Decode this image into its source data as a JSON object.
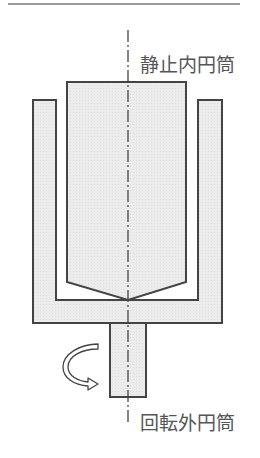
{
  "labels": {
    "inner": "静止内円筒",
    "outer": "回転外円筒"
  },
  "colors": {
    "fill": "#e8e8e8",
    "stroke": "#444444",
    "top_rule": "#999999",
    "text": "#555555"
  }
}
